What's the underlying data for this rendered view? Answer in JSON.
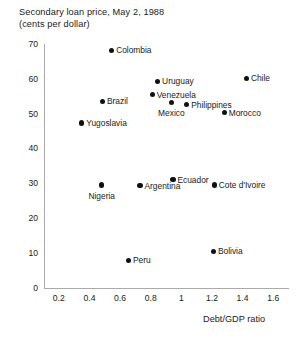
{
  "chart": {
    "title": "Secondary loan price, May 2, 1988",
    "subtitle": "(cents per dollar)"
  },
  "chart_data": {
    "type": "scatter",
    "title": "Secondary loan price, May 2, 1988",
    "subtitle": "(cents per dollar)",
    "xlabel": "Debt/GDP ratio",
    "ylabel": "Secondary loan price, May 2, 1988 (cents per dollar)",
    "xlim": [
      0.1,
      1.7
    ],
    "ylim": [
      0,
      70
    ],
    "xticks": [
      "0.2",
      "0.4",
      "0.6",
      "0.8",
      "1",
      "1.2",
      "1.4",
      "1.6"
    ],
    "xtick_values": [
      0.2,
      0.4,
      0.6,
      0.8,
      1.0,
      1.2,
      1.4,
      1.6
    ],
    "yticks": [
      "0",
      "10",
      "20",
      "30",
      "40",
      "50",
      "60",
      "70"
    ],
    "ytick_values": [
      0,
      10,
      20,
      30,
      40,
      50,
      60,
      70
    ],
    "grid": false,
    "legend": null,
    "points": [
      {
        "label": "Colombia",
        "x": 0.545,
        "y": 68.2,
        "label_pos": "right"
      },
      {
        "label": "Uruguay",
        "x": 0.845,
        "y": 59.3,
        "label_pos": "right"
      },
      {
        "label": "Chile",
        "x": 1.425,
        "y": 60.1,
        "label_pos": "right"
      },
      {
        "label": "Venezuela",
        "x": 0.81,
        "y": 55.4,
        "label_pos": "right"
      },
      {
        "label": "Brazil",
        "x": 0.485,
        "y": 53.5,
        "label_pos": "right"
      },
      {
        "label": "Mexico",
        "x": 0.935,
        "y": 53.2,
        "label_pos": "below"
      },
      {
        "label": "Philippines",
        "x": 1.035,
        "y": 52.6,
        "label_pos": "right"
      },
      {
        "label": "Morocco",
        "x": 1.28,
        "y": 50.3,
        "label_pos": "right"
      },
      {
        "label": "Yugoslavia",
        "x": 0.35,
        "y": 47.3,
        "label_pos": "right"
      },
      {
        "label": "Ecuador",
        "x": 0.945,
        "y": 31.0,
        "label_pos": "right"
      },
      {
        "label": "Argentina",
        "x": 0.73,
        "y": 29.3,
        "label_pos": "right"
      },
      {
        "label": "Cote d'Ivoire",
        "x": 1.215,
        "y": 29.5,
        "label_pos": "right"
      },
      {
        "label": "Nigeria",
        "x": 0.48,
        "y": 29.5,
        "label_pos": "below"
      },
      {
        "label": "Bolivia",
        "x": 1.21,
        "y": 10.4,
        "label_pos": "right"
      },
      {
        "label": "Peru",
        "x": 0.655,
        "y": 7.8,
        "label_pos": "right"
      }
    ]
  }
}
